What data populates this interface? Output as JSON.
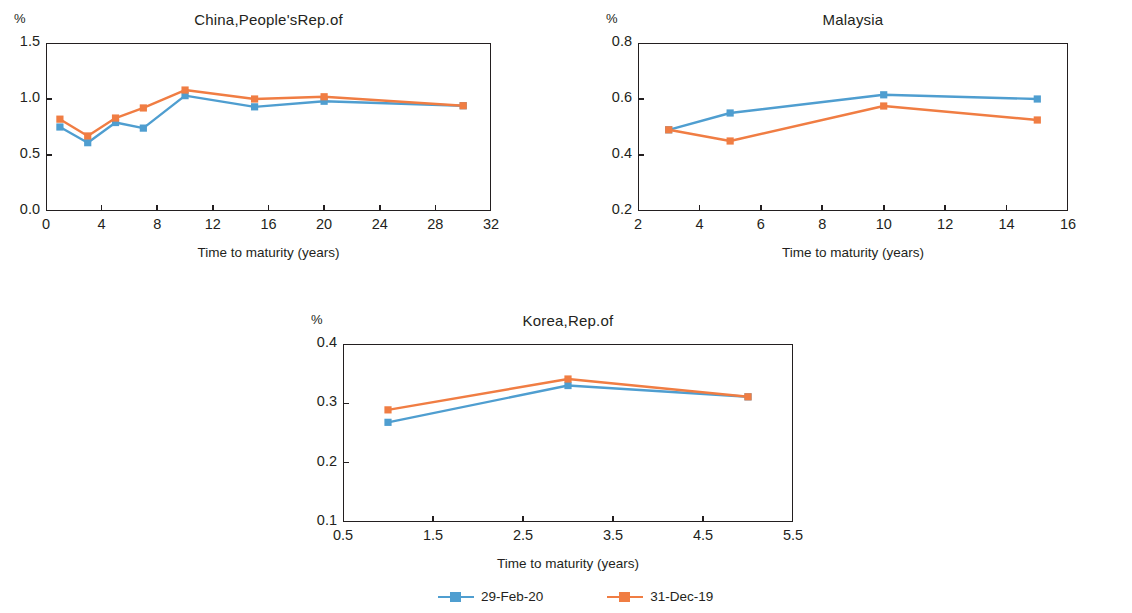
{
  "legend": {
    "items": [
      {
        "label": "29-Feb-20",
        "color": "#4f9ed0"
      },
      {
        "label": "31-Dec-19",
        "color": "#f07d43"
      }
    ]
  },
  "common": {
    "unit_label": "%",
    "xlabel": "Time to maturity (years)"
  },
  "chart_data": [
    {
      "id": "china",
      "type": "line",
      "title": "China,People'sRep.of",
      "xlabel": "Time to maturity (years)",
      "ylabel": "%",
      "xlim": [
        0,
        32
      ],
      "ylim": [
        0.0,
        1.5
      ],
      "xticks": [
        0,
        4,
        8,
        12,
        16,
        20,
        24,
        28,
        32
      ],
      "xtick_labels": [
        "0",
        "4",
        "8",
        "12",
        "16",
        "20",
        "24",
        "28",
        "32"
      ],
      "yticks": [
        0.0,
        0.5,
        1.0,
        1.5
      ],
      "ytick_labels": [
        "0.0",
        "0.5",
        "1.0",
        "1.5"
      ],
      "grid": false,
      "x": [
        1,
        3,
        5,
        7,
        10,
        15,
        20,
        30
      ],
      "series": [
        {
          "name": "29-Feb-20",
          "color": "#4f9ed0",
          "values": [
            0.75,
            0.61,
            0.79,
            0.74,
            1.03,
            0.93,
            0.98,
            0.94
          ]
        },
        {
          "name": "31-Dec-19",
          "color": "#f07d43",
          "values": [
            0.82,
            0.67,
            0.83,
            0.92,
            1.08,
            1.0,
            1.02,
            0.94
          ]
        }
      ]
    },
    {
      "id": "malaysia",
      "type": "line",
      "title": "Malaysia",
      "xlabel": "Time to maturity (years)",
      "ylabel": "%",
      "xlim": [
        2,
        16
      ],
      "ylim": [
        0.2,
        0.8
      ],
      "xticks": [
        2,
        4,
        6,
        8,
        10,
        12,
        14,
        16
      ],
      "xtick_labels": [
        "2",
        "4",
        "6",
        "8",
        "10",
        "12",
        "14",
        "16"
      ],
      "yticks": [
        0.2,
        0.4,
        0.6,
        0.8
      ],
      "ytick_labels": [
        "0.2",
        "0.4",
        "0.6",
        "0.8"
      ],
      "grid": false,
      "x": [
        3,
        5,
        10,
        15
      ],
      "series": [
        {
          "name": "29-Feb-20",
          "color": "#4f9ed0",
          "values": [
            0.49,
            0.55,
            0.615,
            0.6
          ]
        },
        {
          "name": "31-Dec-19",
          "color": "#f07d43",
          "values": [
            0.49,
            0.45,
            0.575,
            0.525
          ]
        }
      ]
    },
    {
      "id": "korea",
      "type": "line",
      "title": "Korea,Rep.of",
      "xlabel": "Time to maturity (years)",
      "ylabel": "%",
      "xlim": [
        0.5,
        5.5
      ],
      "ylim": [
        0.1,
        0.4
      ],
      "xticks": [
        0.5,
        1.5,
        2.5,
        3.5,
        4.5,
        5.5
      ],
      "xtick_labels": [
        "0.5",
        "1.5",
        "2.5",
        "3.5",
        "4.5",
        "5.5"
      ],
      "yticks": [
        0.1,
        0.2,
        0.3,
        0.4
      ],
      "ytick_labels": [
        "0.1",
        "0.2",
        "0.3",
        "0.4"
      ],
      "grid": false,
      "x": [
        1,
        3,
        5
      ],
      "series": [
        {
          "name": "29-Feb-20",
          "color": "#4f9ed0",
          "values": [
            0.268,
            0.33,
            0.311
          ]
        },
        {
          "name": "31-Dec-19",
          "color": "#f07d43",
          "values": [
            0.289,
            0.341,
            0.311
          ]
        }
      ]
    }
  ]
}
